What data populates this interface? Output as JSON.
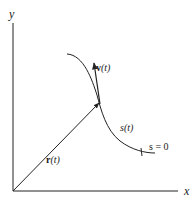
{
  "diagram": {
    "axes": {
      "x_label": "x",
      "y_label": "y"
    },
    "labels": {
      "position_vector": "r(t)",
      "position_vector_bold": "r",
      "velocity_vector_bold": "v",
      "arg": "(t)",
      "arc_length": "s(t)",
      "arc_origin": "s = 0"
    },
    "colors": {
      "ink": "#222222",
      "background": "#ffffff"
    }
  }
}
